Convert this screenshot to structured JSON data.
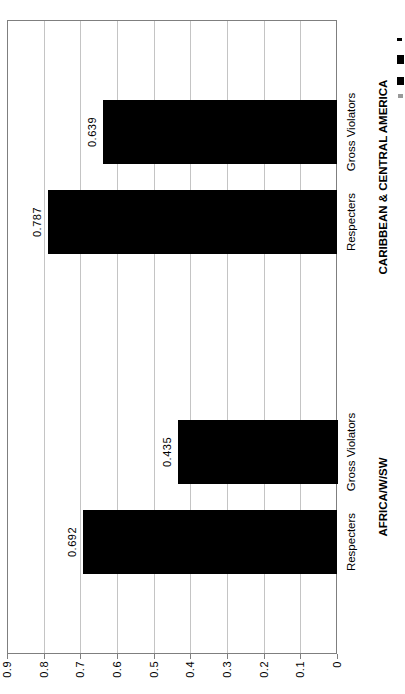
{
  "chart_data": {
    "type": "bar",
    "title": "",
    "orientation": "vertical bars; whole chart rotated 90 degrees counter-clockwise in the screenshot",
    "bar_color": "#000000",
    "grid": true,
    "value_axis": {
      "min": 0,
      "max": 0.9,
      "step": 0.1,
      "tick_labels": [
        "0",
        "0.1",
        "0.2",
        "0.3",
        "0.4",
        "0.5",
        "0.6",
        "0.7",
        "0.8",
        "0.9"
      ]
    },
    "groups": [
      {
        "label": "AFRICA/W/SW",
        "bars": [
          {
            "category": "Respecters",
            "value": 0.692,
            "value_label": "0.692"
          },
          {
            "category": "Gross Violators",
            "value": 0.435,
            "value_label": "0.435"
          }
        ]
      },
      {
        "label": "CARIBBEAN & CENTRAL AMERICA",
        "bars": [
          {
            "category": "Respecters",
            "value": 0.787,
            "value_label": "0.787"
          },
          {
            "category": "Gross Violators",
            "value": 0.639,
            "value_label": "0.639"
          }
        ]
      }
    ]
  },
  "colors": {
    "bar": "#000000",
    "axis": "#7f7f7f",
    "gridline": "#c4c4c4",
    "background": "#ffffff",
    "text": "#000000"
  }
}
